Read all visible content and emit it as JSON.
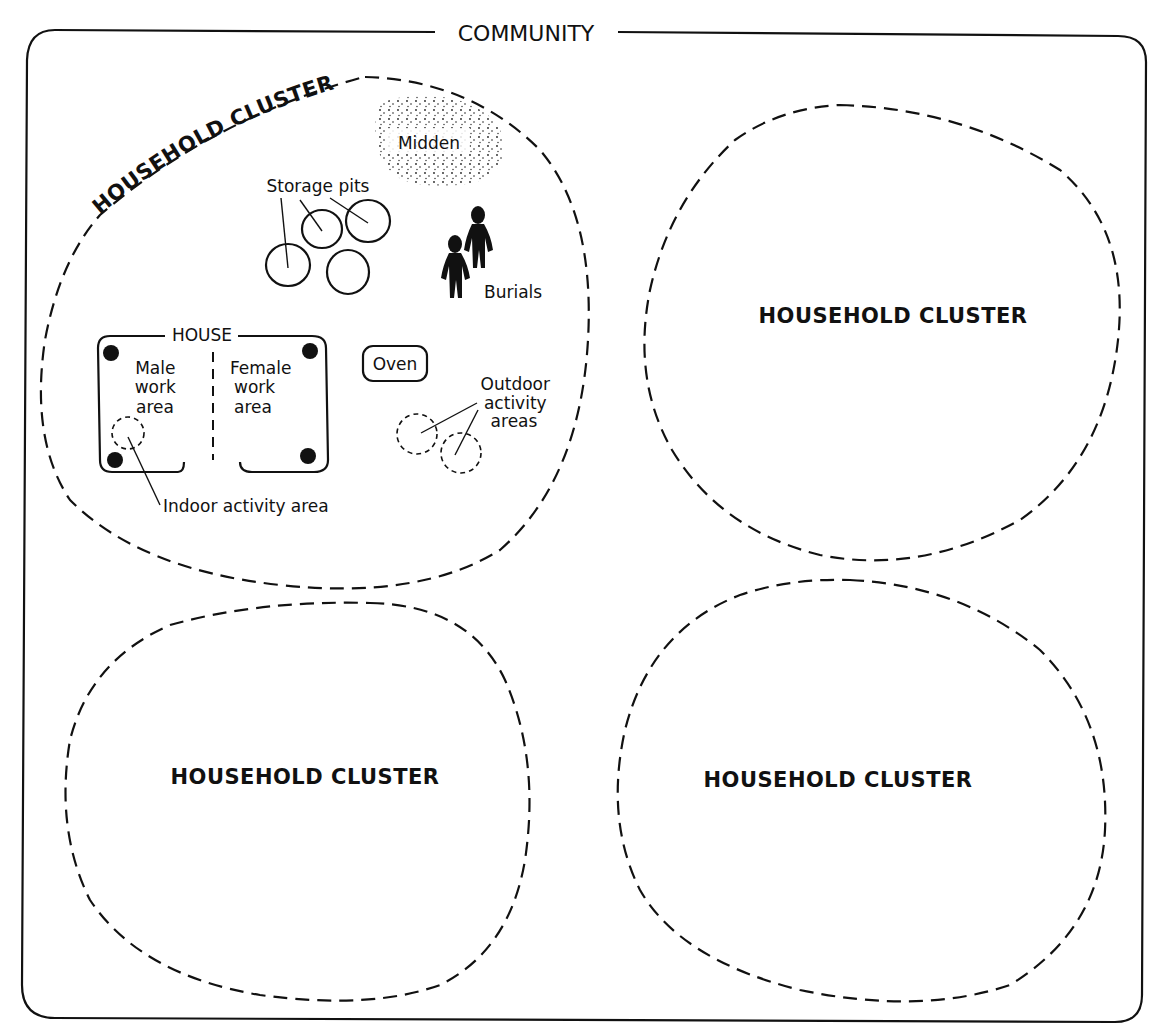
{
  "community": {
    "label": "COMMUNITY"
  },
  "clusters": [
    {
      "label": "HOUSEHOLD CLUSTER",
      "position": "top-left (detailed)"
    },
    {
      "label": "HOUSEHOLD CLUSTER",
      "position": "top-right"
    },
    {
      "label": "HOUSEHOLD CLUSTER",
      "position": "bottom-left"
    },
    {
      "label": "HOUSEHOLD CLUSTER",
      "position": "bottom-right"
    }
  ],
  "detail": {
    "cluster_label": "HOUSEHOLD CLUSTER",
    "midden": "Midden",
    "storage_pits": "Storage pits",
    "burials": "Burials",
    "house": "HOUSE",
    "male_area": [
      "Male",
      "work",
      "area"
    ],
    "female_area": [
      "Female",
      "work",
      "area"
    ],
    "oven": "Oven",
    "outdoor": [
      "Outdoor",
      "activity",
      "areas"
    ],
    "indoor": "Indoor activity area"
  },
  "colors": {
    "ink": "#111111",
    "paper": "#ffffff"
  }
}
